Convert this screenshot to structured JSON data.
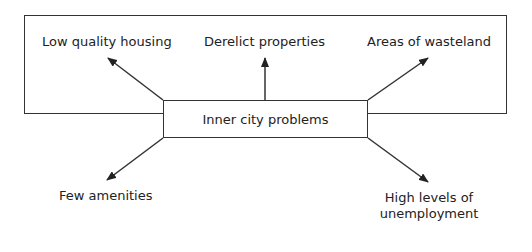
{
  "diagram": {
    "center": {
      "label": "Inner city problems"
    },
    "nodes": [
      {
        "id": "tl",
        "label": "Low quality housing"
      },
      {
        "id": "tc",
        "label": "Derelict properties"
      },
      {
        "id": "tr",
        "label": "Areas of wasteland"
      },
      {
        "id": "bl",
        "label": "Few amenities"
      },
      {
        "id": "br",
        "label": "High levels of\nunemployment",
        "line1": "High levels of",
        "line2": "unemployment"
      }
    ],
    "stroke_color": "#333333"
  }
}
